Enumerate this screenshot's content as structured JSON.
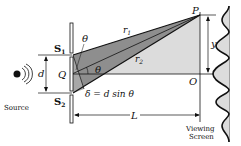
{
  "diagram": {
    "labels": {
      "S1": "S",
      "S1_sub": "1",
      "S2": "S",
      "S2_sub": "2",
      "Q": "Q",
      "P": "P",
      "O": "O",
      "d": "d",
      "y": "y",
      "L": "L",
      "theta_top": "θ",
      "theta_mid": "θ",
      "r1": "r",
      "r1_sub": "1",
      "r2": "r",
      "r2_sub": "2",
      "delta_eq": "δ = d sin θ",
      "source": "Source",
      "screen_line1": "Viewing",
      "screen_line2": "Screen"
    },
    "colors": {
      "dark_wedge": "#8c8c8c",
      "light_region": "#d9d9d9",
      "stroke": "#111111"
    }
  }
}
